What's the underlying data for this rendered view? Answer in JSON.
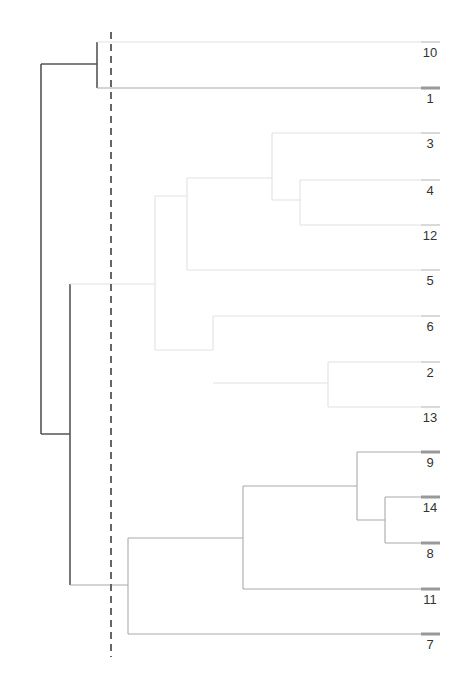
{
  "figure": {
    "type": "dendrogram",
    "orientation": "horizontal (root at left, leaves at right)",
    "cut_line": {
      "style": "dashed",
      "x": 111,
      "y_top": 32,
      "y_bottom": 657,
      "color": "#666666"
    },
    "caption_partial": "10.7 SCHC ... single-link ... dendrogram (caption cut off)",
    "colors": {
      "dark": "#555555",
      "medium": "#aaaaaa",
      "faint": "#e2e2e2",
      "tick": "#999999"
    }
  },
  "leaves": [
    {
      "label": "10",
      "y": 42,
      "tone": "faint"
    },
    {
      "label": "1",
      "y": 88,
      "tone": "medium"
    },
    {
      "label": "3",
      "y": 133,
      "tone": "faint"
    },
    {
      "label": "4",
      "y": 180,
      "tone": "faint"
    },
    {
      "label": "12",
      "y": 225,
      "tone": "faint"
    },
    {
      "label": "5",
      "y": 270,
      "tone": "faint"
    },
    {
      "label": "6",
      "y": 316,
      "tone": "faint"
    },
    {
      "label": "2",
      "y": 362,
      "tone": "faint"
    },
    {
      "label": "13",
      "y": 407,
      "tone": "faint"
    },
    {
      "label": "9",
      "y": 452,
      "tone": "medium"
    },
    {
      "label": "14",
      "y": 497,
      "tone": "medium"
    },
    {
      "label": "8",
      "y": 543,
      "tone": "medium"
    },
    {
      "label": "11",
      "y": 589,
      "tone": "medium"
    },
    {
      "label": "7",
      "y": 634,
      "tone": "medium"
    }
  ],
  "links": [
    {
      "tone": "dark",
      "d": "M41,64 H97 M41,64 V434 M41,434 H70"
    },
    {
      "tone": "dark",
      "d": "M97,42 V88"
    },
    {
      "tone": "faint",
      "d": "M97,42 H421"
    },
    {
      "tone": "medium",
      "d": "M97,88 H421"
    },
    {
      "tone": "dark",
      "d": "M70,284 V585"
    },
    {
      "tone": "faint",
      "d": "M70,284 H155 M155,196 V350 M155,196 H187 M155,350 H213"
    },
    {
      "tone": "faint",
      "d": "M187,178 V270 M187,178 H272 M187,270 H421"
    },
    {
      "tone": "faint",
      "d": "M272,133 V200 M272,133 H421 M272,200 H300 M300,180 V225 M300,180 H421 M300,225 H421"
    },
    {
      "tone": "faint",
      "d": "M213,316 V350 M213,316 H421 M213,383 H328 M328,362 V407 M328,362 H421 M328,407 H421"
    },
    {
      "tone": "medium",
      "d": "M70,585 H128 M128,538 V634 M128,538 H243 M128,634 H421"
    },
    {
      "tone": "medium",
      "d": "M243,486 V589 M243,486 H357 M243,589 H421"
    },
    {
      "tone": "medium",
      "d": "M357,452 V520 M357,452 H421 M357,520 H385 M385,497 V543 M385,497 H421 M385,543 H421"
    }
  ]
}
